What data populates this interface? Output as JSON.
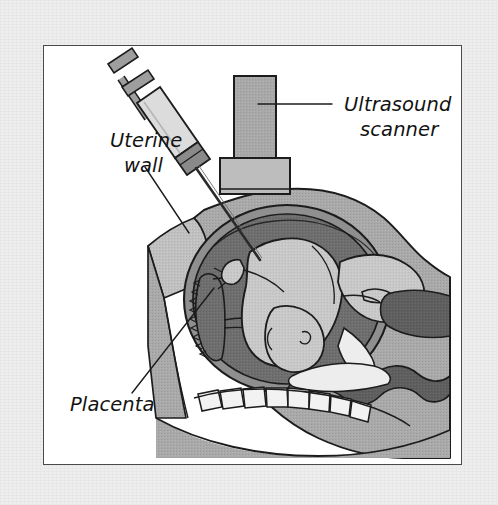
{
  "figure": {
    "frame": {
      "x": 43,
      "y": 45,
      "width": 419,
      "height": 420,
      "background": "#ffffff",
      "border_color": "#4a4a4a"
    },
    "page_background": "#eeeeee"
  },
  "labels": [
    {
      "id": "ultrasound-scanner",
      "lines": [
        "Ultrasound",
        "scanner"
      ],
      "line1": "Ultrasound",
      "line2": "scanner",
      "align": "left",
      "x": 330,
      "y": 104,
      "leader": {
        "x1": 244,
        "y1": 101,
        "x2": 318,
        "y2": 101
      }
    },
    {
      "id": "uterine-wall",
      "lines": [
        "Uterine",
        "wall"
      ],
      "line1": "Uterine",
      "line2": "wall",
      "align": "center",
      "x": 74,
      "y": 137,
      "leader": {
        "x1": 131,
        "y1": 164,
        "x2": 175,
        "y2": 230
      }
    },
    {
      "id": "placenta",
      "lines": [
        "Placenta"
      ],
      "line1": "Placenta",
      "align": "left",
      "x": 68,
      "y": 405,
      "leader": {
        "x1": 118,
        "y1": 390,
        "x2": 200,
        "y2": 285
      }
    }
  ],
  "anatomy": {
    "parts": [
      {
        "name": "maternal-body",
        "label": "Maternal abdomen cross-section",
        "fill": "#a9a9a9"
      },
      {
        "name": "abdominal-wall",
        "label": "Abdominal wall",
        "fill": "#c0c0c0"
      },
      {
        "name": "uterine-wall",
        "label": "Uterine wall",
        "fill": "#8f8f8f"
      },
      {
        "name": "amniotic-fluid",
        "label": "Amniotic cavity",
        "fill": "#6e6e6e"
      },
      {
        "name": "fetus",
        "label": "Fetus",
        "fill": "#c8c8c8"
      },
      {
        "name": "placenta",
        "label": "Placenta",
        "fill": "#6e6e6e"
      },
      {
        "name": "bowel",
        "label": "Maternal bowel",
        "fill": "#5f5f5f"
      },
      {
        "name": "spine",
        "label": "Maternal spine and vertebrae",
        "fill": "#f2f2f2"
      },
      {
        "name": "bladder",
        "label": "Bladder",
        "fill": "#ededed"
      }
    ]
  },
  "instruments": {
    "syringe": {
      "name": "Amniocentesis syringe and needle",
      "barrel_fill": "#dcdcdc",
      "plunger_fill": "#9e9e9e",
      "hub_fill": "#8a8a8a",
      "needle_stroke": "#2b2b2b"
    },
    "scanner": {
      "name": "Ultrasound scanner transducer",
      "handle_fill": "#a8a8a8",
      "base_fill": "#bdbdbd",
      "outline": "#1c1c1c"
    }
  },
  "colors": {
    "outline": "#1c1c1c",
    "page": "#eeeeee",
    "panel": "#ffffff",
    "frame": "#4a4a4a",
    "body": "#a9a9a9",
    "wall": "#c0c0c0",
    "fluid": "#6e6e6e",
    "fetus": "#c8c8c8",
    "bone": "#f2f2f2",
    "bowel": "#5f5f5f"
  }
}
